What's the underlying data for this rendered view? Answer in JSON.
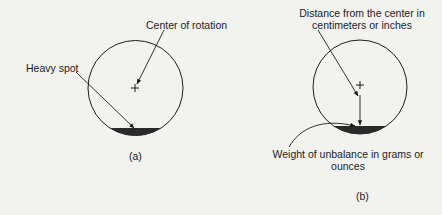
{
  "diagram_a": {
    "caption": "(a)",
    "labels": {
      "center_of_rotation": "Center of rotation",
      "heavy_spot": "Heavy spot"
    },
    "center_mark": "+"
  },
  "diagram_b": {
    "caption": "(b)",
    "labels": {
      "distance_line1": "Distance from the center in",
      "distance_line2": "centimeters or inches",
      "weight_line1": "Weight of unbalance in grams or",
      "weight_line2": "ounces"
    },
    "center_mark": "+"
  },
  "colors": {
    "background": "#f2f2ef",
    "ink": "#1c1c1c",
    "heavy_spot_fill": "#2a2a2a"
  }
}
